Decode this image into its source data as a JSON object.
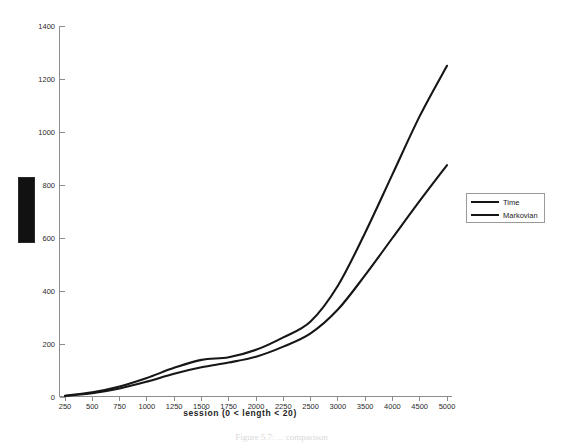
{
  "figure": {
    "background_color": "#ffffff",
    "line_color": "#161616",
    "axis_color": "#8d8d8d"
  },
  "marker_block": {
    "name": "black-block",
    "color": "#111111"
  },
  "xaxis_title": "session (0 < length < 20)",
  "caption": "Figure 5.7: ... comparison",
  "legend": {
    "entries": [
      {
        "label": "Time"
      },
      {
        "label": "Markovian"
      }
    ]
  },
  "chart_data": {
    "type": "line",
    "title": "",
    "xlabel": "session (0 < length < 20)",
    "ylabel": "",
    "xlim": [
      0,
      16
    ],
    "ylim": [
      0,
      1400
    ],
    "grid": false,
    "legend_position": "right",
    "categories": [
      "250",
      "500",
      "750",
      "1000",
      "1250",
      "1500",
      "1750",
      "2000",
      "2250",
      "2500",
      "3000",
      "3500",
      "4000",
      "4500",
      "5000"
    ],
    "xtick_labels": [
      "250",
      "500",
      "750",
      "1000",
      "1250",
      "1500",
      "1750",
      "2000",
      "2250",
      "2500",
      "3000",
      "3500",
      "4000",
      "4500",
      "5000"
    ],
    "ytick_labels": [
      "0",
      "200",
      "400",
      "600",
      "800",
      "1000",
      "1200",
      "1400"
    ],
    "ytick_values": [
      0,
      200,
      400,
      600,
      800,
      1000,
      1200,
      1400
    ],
    "series": [
      {
        "name": "Time",
        "values": [
          5,
          18,
          40,
          72,
          110,
          140,
          150,
          178,
          225,
          285,
          420,
          620,
          840,
          1060,
          1250
        ]
      },
      {
        "name": "Markovian",
        "values": [
          4,
          14,
          32,
          58,
          88,
          112,
          130,
          152,
          190,
          240,
          330,
          460,
          600,
          740,
          875
        ]
      }
    ]
  }
}
